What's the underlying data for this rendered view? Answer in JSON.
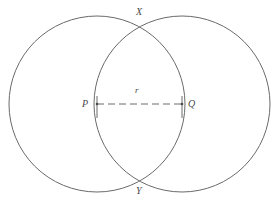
{
  "figure": {
    "kind": "geometry-diagram",
    "background_color": "#ffffff",
    "stroke_color": "#6a6a6a",
    "label_color": "#4a4a4a",
    "stroke_width": 1,
    "width": 277,
    "height": 202
  },
  "labels": {
    "center_left": "P",
    "center_right": "Q",
    "radius": "r",
    "intersection_top": "X",
    "intersection_bottom": "Y"
  },
  "chart_data": {
    "type": "scatter",
    "title": "",
    "xlabel": "",
    "ylabel": "",
    "xlim": [
      0,
      277
    ],
    "ylim": [
      0,
      202
    ],
    "grid": false,
    "legend": "none",
    "circles": [
      {
        "name": "left-circle",
        "cx": 97,
        "cy": 104,
        "r": 88
      },
      {
        "name": "right-circle",
        "cx": 182,
        "cy": 104,
        "r": 88
      }
    ],
    "points": [
      {
        "name": "P",
        "label": "P",
        "x": 97,
        "y": 104
      },
      {
        "name": "Q",
        "label": "Q",
        "x": 182,
        "y": 104
      },
      {
        "name": "X",
        "label": "X",
        "x": 140,
        "y": 27
      },
      {
        "name": "Y",
        "label": "Y",
        "x": 140,
        "y": 181
      }
    ],
    "segments": [
      {
        "name": "radius-segment",
        "label": "r",
        "from": "P",
        "to": "Q",
        "x1": 97,
        "y1": 104,
        "x2": 182,
        "y2": 104,
        "style": "dashed",
        "dash_pattern": "7 4",
        "length": 85
      }
    ]
  }
}
